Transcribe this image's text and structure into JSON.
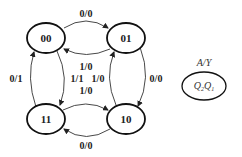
{
  "diagram": {
    "type": "state-transition",
    "states": [
      {
        "id": "s00",
        "label": "00"
      },
      {
        "id": "s01",
        "label": "01"
      },
      {
        "id": "s11",
        "label": "11"
      },
      {
        "id": "s10",
        "label": "10"
      }
    ],
    "transitions": [
      {
        "from": "00",
        "to": "01",
        "label": "0/0"
      },
      {
        "from": "01",
        "to": "00",
        "label": "1/0"
      },
      {
        "from": "01",
        "to": "10",
        "label": "0/0"
      },
      {
        "from": "10",
        "to": "01",
        "label": "1/0"
      },
      {
        "from": "00",
        "to": "11",
        "label": "1/1"
      },
      {
        "from": "11",
        "to": "00",
        "label": "0/1"
      },
      {
        "from": "11",
        "to": "10",
        "label": "1/0"
      },
      {
        "from": "10",
        "to": "11",
        "label": "0/0"
      }
    ],
    "legend": {
      "edge_label": "A/Y",
      "state_label_main": "Q",
      "state_label_sub1": "2",
      "state_label_sub2": "1"
    }
  }
}
